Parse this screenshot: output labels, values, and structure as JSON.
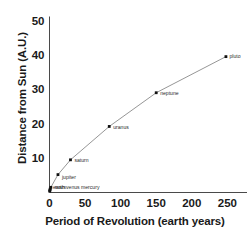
{
  "chart_data": {
    "type": "line",
    "title": "",
    "xlabel": "Period of Revolution (earth years)",
    "ylabel": "Distance from Sun (A.U.)",
    "xlim": [
      0,
      272
    ],
    "ylim": [
      0,
      50
    ],
    "xticks": [
      0,
      50,
      100,
      150,
      200,
      250
    ],
    "xticklabels": [
      "0",
      "50",
      "100",
      "150",
      "200",
      "250"
    ],
    "yticks": [
      10,
      20,
      30,
      40,
      50
    ],
    "yticklabels": [
      "10",
      "20",
      "30",
      "40",
      "50"
    ],
    "grid": false,
    "legend": null,
    "series": [
      {
        "name": "planets",
        "x": [
          0.24,
          0.62,
          1.0,
          1.88,
          11.9,
          29.5,
          84.0,
          150.0,
          248.0
        ],
        "y": [
          0.4,
          0.7,
          1.0,
          1.5,
          5.2,
          9.5,
          19.2,
          29.0,
          39.5
        ],
        "labels": [
          "mercury",
          "venus",
          "earth",
          "mars",
          "jupiter",
          "saturn",
          "uranus",
          "neptune",
          "pluto"
        ]
      }
    ],
    "annotations": [
      {
        "text": "mercury",
        "x": 0.24,
        "y": 0.4
      },
      {
        "text": "venus",
        "x": 0.62,
        "y": 0.7
      },
      {
        "text": "earth",
        "x": 1.0,
        "y": 1.0
      },
      {
        "text": "mars",
        "x": 1.88,
        "y": 1.5
      },
      {
        "text": "jupiter",
        "x": 11.9,
        "y": 5.2
      },
      {
        "text": "saturn",
        "x": 29.5,
        "y": 9.5
      },
      {
        "text": "uranus",
        "x": 84.0,
        "y": 19.2
      },
      {
        "text": "neptune",
        "x": 150.0,
        "y": 29.0
      },
      {
        "text": "pluto",
        "x": 248.0,
        "y": 39.5
      }
    ],
    "inner_cluster_label": "earth venus mercury",
    "colors": {
      "line": "#8a8a8a",
      "marker": "#111111",
      "axis": "#4a4a4a",
      "text": "#1a1a1a",
      "background": "#ffffff"
    }
  }
}
